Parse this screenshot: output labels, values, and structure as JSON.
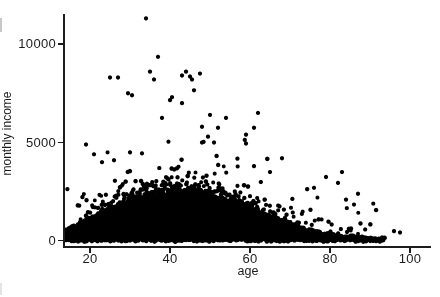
{
  "figure": {
    "background_color": "#ffffff",
    "axis_color": "#1c1c1c",
    "label_color": "#1c1c1c"
  },
  "chart_data": {
    "type": "scatter",
    "title": "",
    "xlabel": "age",
    "ylabel": "monthly income",
    "x_ticks": [
      20,
      40,
      60,
      80,
      100
    ],
    "y_ticks": [
      0,
      5000,
      10000
    ],
    "xlim": [
      13.5,
      105
    ],
    "ylim": [
      -300,
      11500
    ],
    "grid": false,
    "legend": null,
    "marker": {
      "shape": "circle",
      "color": "#000000",
      "diameter_px": 4.2
    },
    "dense_cloud": {
      "description": "Several thousand overlapping solid black points forming a dense mass from income 0 up to an age-dependent upper envelope; the mass rises from about 600 at age 14 to a peak of about 2500 around ages 42-46, then declines to near 0 by the mid 90s. A fuzzy band of sparser points sits above the solid mass, mainly between ages 25 and 60.",
      "age_range": [
        14,
        93.5
      ],
      "envelope_age_income": [
        [
          14,
          600
        ],
        [
          16,
          820
        ],
        [
          18,
          1000
        ],
        [
          20,
          1220
        ],
        [
          23,
          1520
        ],
        [
          26,
          1780
        ],
        [
          30,
          2080
        ],
        [
          34,
          2280
        ],
        [
          38,
          2400
        ],
        [
          42,
          2480
        ],
        [
          46,
          2470
        ],
        [
          50,
          2370
        ],
        [
          54,
          2150
        ],
        [
          58,
          1880
        ],
        [
          62,
          1530
        ],
        [
          66,
          1250
        ],
        [
          70,
          950
        ],
        [
          74,
          640
        ],
        [
          78,
          440
        ],
        [
          82,
          330
        ],
        [
          86,
          260
        ],
        [
          90,
          205
        ],
        [
          93.5,
          150
        ]
      ],
      "scatter_above_envelope": {
        "rate_by_age": [
          [
            14,
            0.25
          ],
          [
            20,
            0.7
          ],
          [
            26,
            1.5
          ],
          [
            32,
            2.4
          ],
          [
            40,
            2.6
          ],
          [
            50,
            2.3
          ],
          [
            58,
            1.6
          ],
          [
            66,
            1.0
          ],
          [
            74,
            0.7
          ],
          [
            82,
            0.5
          ],
          [
            88,
            0.3
          ],
          [
            93,
            0.1
          ]
        ],
        "short_tail_mean": 340,
        "long_tail_mean": 1050,
        "long_tail_prob": 0.2,
        "max_income": 5550
      },
      "generator": {
        "seed": 11,
        "age_step": 0.35,
        "income_step": 90
      }
    },
    "outlier_points_age_income": [
      [
        34,
        11300
      ],
      [
        37,
        9350
      ],
      [
        35,
        8600
      ],
      [
        36,
        8200
      ],
      [
        25,
        8300
      ],
      [
        27,
        8300
      ],
      [
        29.5,
        7500
      ],
      [
        43,
        8400
      ],
      [
        44,
        8600
      ],
      [
        45,
        8350
      ],
      [
        45.5,
        8200
      ],
      [
        47.5,
        8500
      ],
      [
        46,
        7650
      ],
      [
        40.5,
        7300
      ],
      [
        30.5,
        7400
      ],
      [
        40,
        7150
      ],
      [
        43,
        7000
      ],
      [
        38,
        6250
      ],
      [
        50,
        6400
      ],
      [
        54,
        6250
      ],
      [
        62,
        6500
      ],
      [
        61,
        5750
      ],
      [
        48,
        5800
      ],
      [
        59,
        5400
      ],
      [
        52,
        5750
      ],
      [
        49.5,
        5300
      ],
      [
        48,
        5000
      ],
      [
        51,
        5000
      ],
      [
        19,
        4900
      ],
      [
        21,
        4400
      ],
      [
        23,
        4000
      ],
      [
        26,
        4100
      ],
      [
        30,
        4500
      ],
      [
        33,
        4450
      ],
      [
        59,
        4950
      ],
      [
        68,
        4200
      ],
      [
        61,
        3800
      ],
      [
        65,
        3500
      ],
      [
        79,
        3250
      ],
      [
        83,
        3500
      ],
      [
        82,
        2950
      ],
      [
        84,
        2100
      ],
      [
        86,
        1850
      ],
      [
        87,
        2400
      ],
      [
        76,
        2700
      ],
      [
        96,
        500
      ],
      [
        97.5,
        430
      ]
    ],
    "axis_layout": {
      "x_axis_px": {
        "age20": 90,
        "px_per_year": 4
      },
      "y_axis_px": {
        "income0": 241,
        "px_per_income_unit": 0.0197
      }
    }
  }
}
